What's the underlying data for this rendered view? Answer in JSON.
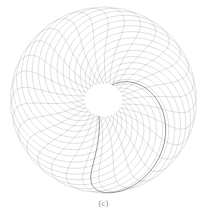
{
  "figure": {
    "caption": "(c)",
    "background_color": "#ffffff",
    "stroke_color": "#5a5a62",
    "accent_stroke_color": "#3c3c44",
    "center_hole_color": "#ffffff"
  },
  "chart_data": {
    "type": "line",
    "title": "",
    "subtitle": "",
    "xlabel": "",
    "ylabel": "",
    "grid": false,
    "legend": null,
    "axes_visible": false,
    "tick_labels": [],
    "annotations": [
      "(c)"
    ],
    "plot_center": [
      103.5,
      100
    ],
    "outer_radius": 93,
    "inner_hole_radius": 18,
    "curve_count": 30,
    "swirl_direction": "counter-clockwise",
    "swirl_twist_degrees": 62,
    "curve_model": "hypotrochoid",
    "curve_params": {
      "R": 93,
      "r": 30,
      "d": 62,
      "loop_points": 240
    },
    "series": [
      {
        "name": "curve-01",
        "rotation_deg": 0,
        "weight": 0.55
      },
      {
        "name": "curve-02",
        "rotation_deg": 12,
        "weight": 0.55
      },
      {
        "name": "curve-03",
        "rotation_deg": 24,
        "weight": 0.55
      },
      {
        "name": "curve-04",
        "rotation_deg": 36,
        "weight": 0.55
      },
      {
        "name": "curve-05",
        "rotation_deg": 48,
        "weight": 0.55
      },
      {
        "name": "curve-06",
        "rotation_deg": 60,
        "weight": 0.55
      },
      {
        "name": "curve-07",
        "rotation_deg": 72,
        "weight": 0.55
      },
      {
        "name": "curve-08",
        "rotation_deg": 84,
        "weight": 0.55
      },
      {
        "name": "curve-09",
        "rotation_deg": 96,
        "weight": 0.55
      },
      {
        "name": "curve-10",
        "rotation_deg": 108,
        "weight": 0.55
      },
      {
        "name": "curve-11",
        "rotation_deg": 120,
        "weight": 0.55
      },
      {
        "name": "curve-12",
        "rotation_deg": 132,
        "weight": 0.55
      },
      {
        "name": "curve-13",
        "rotation_deg": 144,
        "weight": 0.55
      },
      {
        "name": "curve-14",
        "rotation_deg": 156,
        "weight": 0.55
      },
      {
        "name": "curve-15",
        "rotation_deg": 168,
        "weight": 0.55
      },
      {
        "name": "curve-16",
        "rotation_deg": 180,
        "weight": 0.55
      },
      {
        "name": "curve-17",
        "rotation_deg": 192,
        "weight": 0.55
      },
      {
        "name": "curve-18",
        "rotation_deg": 204,
        "weight": 0.55
      },
      {
        "name": "curve-19",
        "rotation_deg": 216,
        "weight": 0.55
      },
      {
        "name": "curve-20",
        "rotation_deg": 228,
        "weight": 0.55
      },
      {
        "name": "curve-21",
        "rotation_deg": 240,
        "weight": 0.55
      },
      {
        "name": "curve-22",
        "rotation_deg": 252,
        "weight": 0.55
      },
      {
        "name": "curve-23",
        "rotation_deg": 264,
        "weight": 0.55
      },
      {
        "name": "curve-24",
        "rotation_deg": 276,
        "weight": 0.55
      },
      {
        "name": "curve-25",
        "rotation_deg": 288,
        "weight": 0.55
      },
      {
        "name": "curve-26",
        "rotation_deg": 300,
        "weight": 0.55
      },
      {
        "name": "curve-27",
        "rotation_deg": 312,
        "weight": 0.55
      },
      {
        "name": "curve-28",
        "rotation_deg": 324,
        "weight": 0.55
      },
      {
        "name": "curve-29",
        "rotation_deg": 336,
        "weight": 0.55
      },
      {
        "name": "curve-30",
        "rotation_deg": 348,
        "weight": 0.55
      }
    ],
    "emphasis_curve": {
      "name": "curve-accent",
      "rotation_deg": 30,
      "weight": 1.0
    }
  }
}
